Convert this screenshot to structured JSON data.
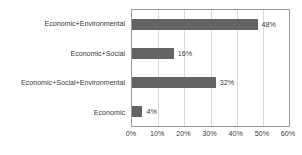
{
  "chart_data": {
    "type": "bar",
    "orientation": "horizontal",
    "title": "",
    "xlabel": "",
    "ylabel": "",
    "categories": [
      "Economic+Environmental",
      "Economic+Social",
      "Economic+Social+Environmental",
      "Economic"
    ],
    "values": [
      48,
      16,
      32,
      4
    ],
    "value_labels": [
      "48%",
      "16%",
      "32%",
      "4%"
    ],
    "xlim": [
      0,
      60
    ],
    "xticks": [
      0,
      10,
      20,
      30,
      40,
      50,
      60
    ],
    "xticklabels": [
      "0%",
      "10%",
      "20%",
      "30%",
      "40%",
      "50%",
      "60%"
    ],
    "grid": "vertical",
    "legend": "none",
    "colors": {
      "bar": "#646464",
      "gridline": "#d9d9d9",
      "axis_border": "#9a9a9a",
      "text": "#3b3b3b",
      "background": "#ffffff"
    }
  }
}
